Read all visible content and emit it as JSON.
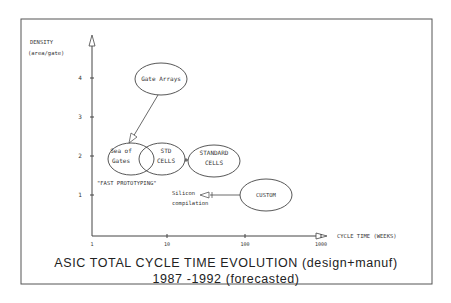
{
  "title": {
    "line1": "ASIC TOTAL CYCLE TIME EVOLUTION (design+manuf)",
    "line2": "1987 -1992  (forecasted)"
  },
  "y_axis": {
    "label_line1": "DENSITY",
    "label_line2": "(area/gate)",
    "ticks": [
      "1",
      "2",
      "3",
      "4"
    ]
  },
  "x_axis": {
    "label": "CYCLE TIME (WEEKS)",
    "ticks": [
      "1",
      "10",
      "100",
      "1000"
    ]
  },
  "nodes": {
    "gate_arrays": "Gate Arrays",
    "sea_of_gates_l1": "Sea of",
    "sea_of_gates_l2": "Gates",
    "std_cells_l1": "STD",
    "std_cells_l2": "CELLS",
    "standard_cells_l1": "STANDARD",
    "standard_cells_l2": "CELLS",
    "custom": "CUSTOM"
  },
  "annotations": {
    "fast_prototyping": "\"FAST PROTOTYPING\"",
    "silicon_l1": "Silicon",
    "silicon_l2": "compilation"
  },
  "colors": {
    "ink": "#333333",
    "frame": "#555555",
    "background": "#ffffff"
  }
}
